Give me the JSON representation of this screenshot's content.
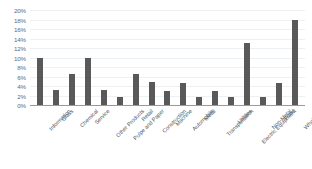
{
  "chart_data": {
    "type": "bar",
    "title": "",
    "xlabel": "",
    "ylabel": "",
    "ylim": [
      0,
      20
    ],
    "y_unit": "%",
    "grid": true,
    "legend": "none",
    "bar_color": "#595959",
    "gridline_color": "#eef1f4",
    "axis_color": "#9a9a9a",
    "tick_label_color": "#5b6b7c",
    "yticks": [
      0,
      2,
      4,
      6,
      8,
      10,
      12,
      14,
      16,
      18,
      20
    ],
    "ytick_labels": [
      "0%",
      "2%",
      "4%",
      "6%",
      "8%",
      "10%",
      "12%",
      "14%",
      "16%",
      "18%",
      "20%"
    ],
    "categories": [
      "Information",
      "Glass",
      "Chemical",
      "Service",
      "Other Products",
      "Pulpe and Paper",
      "Retail",
      "Construction",
      "Machine",
      "Automobile",
      "Metal",
      "Transportation",
      "Utilities",
      "Electric Equipment",
      "Non-Metal",
      "Food",
      "Wholesale"
    ],
    "values": [
      10.0,
      3.1,
      6.5,
      10.0,
      3.1,
      1.7,
      6.6,
      4.8,
      3.0,
      4.7,
      1.6,
      3.0,
      1.6,
      13.0,
      1.6,
      4.7,
      18.0
    ]
  }
}
